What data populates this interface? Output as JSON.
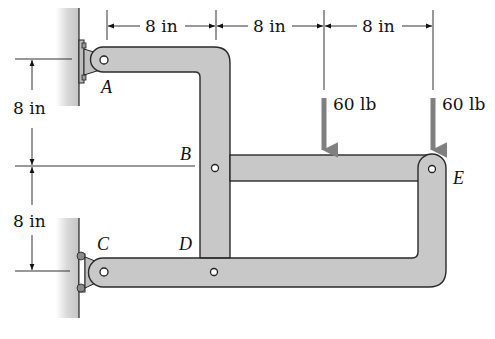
{
  "diagram": {
    "points": {
      "A": "A",
      "B": "B",
      "C": "C",
      "D": "D",
      "E": "E"
    },
    "horizontal_dimensions": [
      "8 in",
      "8 in",
      "8 in"
    ],
    "vertical_dimensions": [
      "8 in",
      "8 in"
    ],
    "loads": [
      {
        "label": "60 lb",
        "position": "middle of member BE"
      },
      {
        "label": "60 lb",
        "position": "at pin E"
      }
    ],
    "colors": {
      "member_fill": "#c8c8c8",
      "member_stroke": "#2a2a2a",
      "load_arrow": "#808080",
      "wall": "#d4d4d4",
      "dimension_line": "#333333"
    }
  }
}
